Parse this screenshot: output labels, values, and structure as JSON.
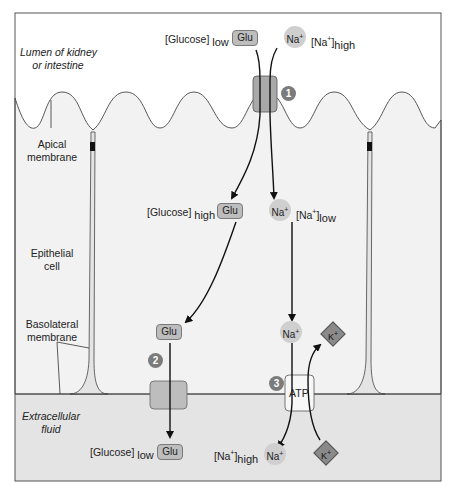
{
  "regions": {
    "lumen": "Lumen of kidney or intestine",
    "lumen_line1": "Lumen of kidney",
    "lumen_line2": "or intestine",
    "apical_line1": "Apical",
    "apical_line2": "membrane",
    "cell_line1": "Epithelial",
    "cell_line2": "cell",
    "basolateral_line1": "Basolateral",
    "basolateral_line2": "membrane",
    "ecf_line1": "Extracellular",
    "ecf_line2": "fluid"
  },
  "molecules": {
    "glu": "Glu",
    "na": "Na",
    "na_sup": "+",
    "k": "K",
    "k_sup": "+",
    "atp": "ATP"
  },
  "concentrations": {
    "glucose_lumen": {
      "name": "[Glucose]",
      "level": "low"
    },
    "na_lumen": {
      "name": "[Na",
      "sup": "+",
      "close": "]",
      "level": "high"
    },
    "glucose_cell": {
      "name": "[Glucose]",
      "level": "high"
    },
    "na_cell": {
      "name": "[Na",
      "sup": "+",
      "close": "]",
      "level": "low"
    },
    "glucose_ecf": {
      "name": "[Glucose]",
      "level": "low"
    },
    "na_ecf": {
      "name": "[Na",
      "sup": "+",
      "close": "]",
      "level": "high"
    }
  },
  "steps": [
    "1",
    "2",
    "3"
  ],
  "colors": {
    "lumen": "#ffffff",
    "cell": "#f2f2f2",
    "ecf": "#e4e4e4",
    "transporter": "#a9a9a9",
    "glu_box": "#bdbdbd",
    "na_circle": "#cfcfcf",
    "k_diamond": "#8a8a8a",
    "step_badge": "#7b7b7b"
  }
}
